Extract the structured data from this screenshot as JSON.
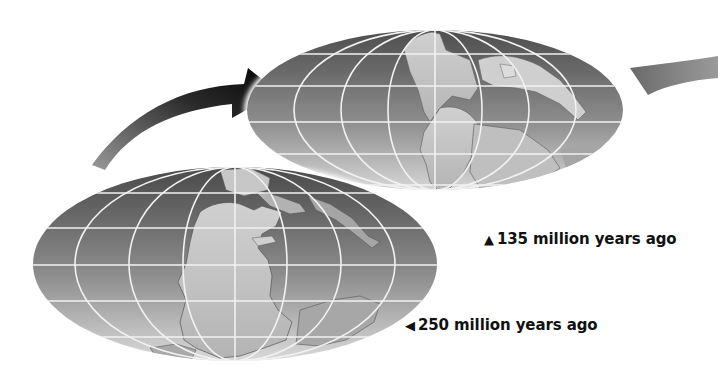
{
  "figure": {
    "type": "paleogeographic globe sequence",
    "globes": [
      {
        "id": "globe-250",
        "caption": "250 million years ago",
        "marker": "◀",
        "center": [
          235,
          264
        ],
        "rx": 202,
        "ry": 97
      },
      {
        "id": "globe-135",
        "caption": "135 million years ago",
        "marker": "▲",
        "center": [
          435,
          110
        ],
        "rx": 188,
        "ry": 80
      }
    ],
    "arrows": [
      {
        "id": "arrow-to-135",
        "direction": "up-right",
        "style": "gradient black"
      },
      {
        "id": "arrow-to-next",
        "direction": "right",
        "style": "partial gray"
      }
    ],
    "colors": {
      "ocean_dark": "#5a5a5a",
      "ocean_light": "#c9c9c9",
      "land": "#bdbdbd",
      "land_light": "#d8d8d8",
      "shelf": "#9a9a9a",
      "grid": "#f2f2f2",
      "arrow": "#111111"
    }
  },
  "labels": {
    "cap_135": "135 million years ago",
    "cap_135_marker": "▲",
    "cap_250": "250 million years ago",
    "cap_250_marker": "◀"
  }
}
